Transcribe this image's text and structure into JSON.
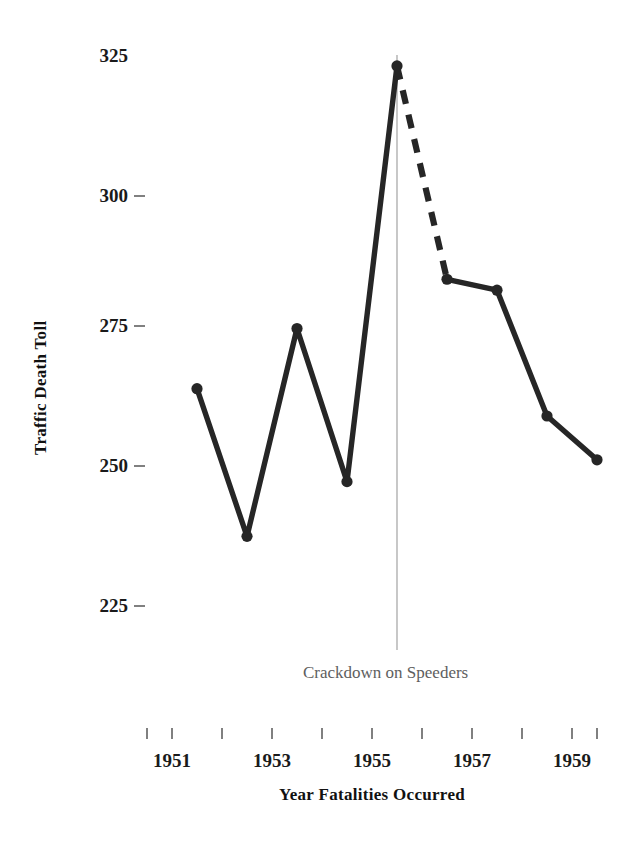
{
  "chart_data": {
    "type": "line",
    "title": "",
    "xlabel": "Year Fatalities Occurred",
    "ylabel": "Traffic Death Toll",
    "x": [
      1951,
      1952,
      1953,
      1954,
      1955,
      1956,
      1957,
      1958,
      1959
    ],
    "values": [
      264,
      237,
      275,
      247,
      323,
      284,
      282,
      259,
      251
    ],
    "xtick_labels": [
      "1951",
      "1953",
      "1955",
      "1957",
      "1959"
    ],
    "xtick_values": [
      1951,
      1953,
      1955,
      1957,
      1959
    ],
    "xminor_ticks": [
      1950,
      1951,
      1952,
      1953,
      1954,
      1955,
      1956,
      1957,
      1958,
      1959,
      1960
    ],
    "ytick_labels": [
      "325",
      "300",
      "275",
      "250",
      "225"
    ],
    "ytick_values": [
      325,
      300,
      275,
      250,
      225
    ],
    "xlim": [
      1950.0,
      1960.0
    ],
    "ylim": [
      218,
      326
    ],
    "grid": false,
    "legend": false,
    "line_color": "#262626",
    "marker": "circle",
    "dashed_segment": {
      "from": 1955,
      "to": 1956,
      "note": "transition segment drawn dashed"
    },
    "annotations": [
      {
        "text": "Crackdown on Speeders",
        "x": 1955.5,
        "type": "vertical-rule-with-label",
        "rule_color": "#9a9a9a",
        "text_color": "#5e5e5e"
      }
    ]
  },
  "axis": {
    "y_title": "Traffic Death Toll",
    "x_title": "Year Fatalities Occurred"
  },
  "annotation": {
    "label": "Crackdown on Speeders"
  }
}
